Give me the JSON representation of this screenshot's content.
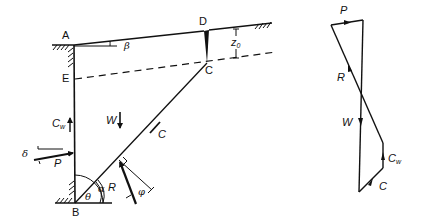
{
  "figure": {
    "points": {
      "A": "A",
      "B": "B",
      "C": "C",
      "D": "D",
      "E": "E"
    },
    "angles": {
      "beta": "β",
      "delta": "δ",
      "alpha": "α",
      "theta": "θ",
      "phi": "φ"
    },
    "dimensions": {
      "z0_main": "z",
      "z0_sub": "0"
    },
    "forces": {
      "W": "W",
      "P": "P",
      "R": "R",
      "C": "C",
      "Cw_main": "C",
      "Cw_sub": "w"
    },
    "polygon": {
      "P": "P",
      "R": "R",
      "W": "W",
      "C": "C",
      "Cw_main": "C",
      "Cw_sub": "w"
    }
  }
}
